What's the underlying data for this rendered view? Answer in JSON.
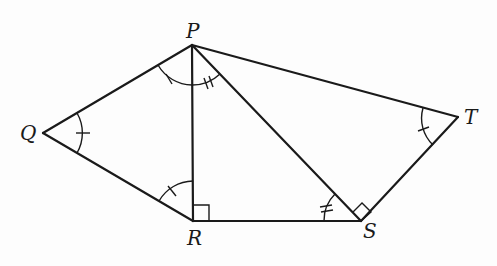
{
  "figure": {
    "type": "geometry-diagram",
    "vertices": {
      "P": {
        "label": "P",
        "x": 192,
        "y": 45
      },
      "Q": {
        "label": "Q",
        "x": 43,
        "y": 133
      },
      "R": {
        "label": "R",
        "x": 193,
        "y": 221
      },
      "S": {
        "label": "S",
        "x": 361,
        "y": 221
      },
      "T": {
        "label": "T",
        "x": 458,
        "y": 117
      }
    },
    "segments": [
      "PQ",
      "QR",
      "PR",
      "RS",
      "PS",
      "PT",
      "ST"
    ],
    "angle_marks": [
      {
        "angle": "PQR",
        "ticks": 1
      },
      {
        "angle": "QPR",
        "ticks": 1
      },
      {
        "angle": "PRQ",
        "ticks": 1
      },
      {
        "angle": "PTS",
        "ticks": 1
      },
      {
        "angle": "RPS",
        "ticks": 2
      },
      {
        "angle": "PSR",
        "ticks": 2
      }
    ],
    "right_angles": [
      "PRS",
      "PST"
    ],
    "stroke_color": "#1a1a1a",
    "background_color": "#fdfdfd"
  }
}
